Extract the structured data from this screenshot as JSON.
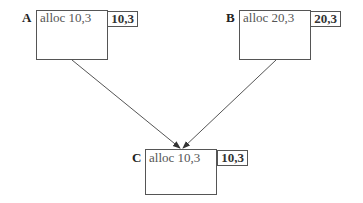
{
  "nodes": [
    {
      "id": "A",
      "label": "A",
      "text": "alloc 10,3",
      "tag": "10,3"
    },
    {
      "id": "B",
      "label": "B",
      "text": "alloc 20,3",
      "tag": "20,3"
    },
    {
      "id": "C",
      "label": "C",
      "text": "alloc 10,3",
      "tag": "10,3"
    }
  ],
  "edges": [
    {
      "from": "A",
      "to": "C"
    },
    {
      "from": "B",
      "to": "C"
    }
  ],
  "colors": {
    "stroke": "#555555",
    "text": "#555555",
    "label": "#222222"
  }
}
